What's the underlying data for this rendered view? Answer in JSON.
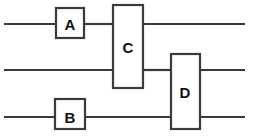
{
  "diagram": {
    "type": "quantum-circuit",
    "canvas": {
      "width": 254,
      "height": 139,
      "background": "#ffffff"
    },
    "style": {
      "line_color": "#3a3a3a",
      "line_width": 2.2,
      "box_fill": "#ffffff",
      "label_color": "#111111",
      "label_font_size": 15
    },
    "wires": [
      {
        "id": "wire-1",
        "label": "",
        "y": 24,
        "x_start": 4,
        "x_end": 245
      },
      {
        "id": "wire-2",
        "label": "",
        "y": 70,
        "x_start": 4,
        "x_end": 245
      },
      {
        "id": "wire-3",
        "label": "",
        "y": 117,
        "x_start": 4,
        "x_end": 245
      }
    ],
    "gates": [
      {
        "id": "gate-a",
        "label": "A",
        "x": 56,
        "y": 8,
        "width": 28,
        "height": 30,
        "label_x": 70,
        "label_y": 24,
        "spans_wires": [
          1
        ]
      },
      {
        "id": "gate-c",
        "label": "C",
        "x": 113,
        "y": 5,
        "width": 30,
        "height": 83,
        "label_x": 128,
        "label_y": 47,
        "spans_wires": [
          1,
          2
        ]
      },
      {
        "id": "gate-d",
        "label": "D",
        "x": 171,
        "y": 54,
        "width": 29,
        "height": 75,
        "label_x": 185,
        "label_y": 92,
        "spans_wires": [
          2,
          3
        ]
      },
      {
        "id": "gate-b",
        "label": "B",
        "x": 55,
        "y": 99,
        "width": 30,
        "height": 30,
        "label_x": 70,
        "label_y": 117,
        "spans_wires": [
          3
        ]
      }
    ],
    "wire_segments": [
      {
        "id": "seg-w1-a",
        "x1": 4,
        "y1": 24,
        "x2": 56,
        "y2": 24
      },
      {
        "id": "seg-w1-b",
        "x1": 84,
        "y1": 24,
        "x2": 113,
        "y2": 24
      },
      {
        "id": "seg-w1-c",
        "x1": 143,
        "y1": 24,
        "x2": 245,
        "y2": 24
      },
      {
        "id": "seg-w2-a",
        "x1": 4,
        "y1": 70,
        "x2": 113,
        "y2": 70
      },
      {
        "id": "seg-w2-b",
        "x1": 143,
        "y1": 70,
        "x2": 171,
        "y2": 70
      },
      {
        "id": "seg-w2-c",
        "x1": 200,
        "y1": 70,
        "x2": 245,
        "y2": 70
      },
      {
        "id": "seg-w3-a",
        "x1": 4,
        "y1": 117,
        "x2": 55,
        "y2": 117
      },
      {
        "id": "seg-w3-b",
        "x1": 85,
        "y1": 117,
        "x2": 171,
        "y2": 117
      },
      {
        "id": "seg-w3-c",
        "x1": 200,
        "y1": 117,
        "x2": 245,
        "y2": 117
      }
    ]
  }
}
